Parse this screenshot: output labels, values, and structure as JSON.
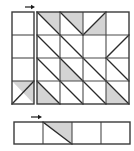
{
  "figure": {
    "background_color": "#ffffff",
    "shade_color": "#d4d4d4",
    "line_color": "#3a3a3a",
    "diagonal_color": "#2b2b2b",
    "arrow_color": "#1a1a1a",
    "width_px": 134,
    "height_px": 151
  },
  "left_strip": {
    "name": "left vertical strip",
    "x": 12,
    "y": 12,
    "width": 22,
    "height": 92,
    "columns": 1,
    "rows": 4,
    "cells": [
      {
        "row": 0,
        "col": 0,
        "diagonal": "none",
        "shaded_half": "none"
      },
      {
        "row": 1,
        "col": 0,
        "diagonal": "none",
        "shaded_half": "none"
      },
      {
        "row": 2,
        "col": 0,
        "diagonal": "none",
        "shaded_half": "none"
      },
      {
        "row": 3,
        "col": 0,
        "diagonal": "anti",
        "shaded_half": "upper-right"
      }
    ],
    "arrow": {
      "x1": 25,
      "y1": 7,
      "x2": 35,
      "y2": 7,
      "direction": "right"
    }
  },
  "main_grid": {
    "name": "main four by four grid",
    "x": 37,
    "y": 12,
    "width": 92,
    "height": 92,
    "columns": 4,
    "rows": 4,
    "cells": [
      {
        "row": 0,
        "col": 0,
        "diagonal": "main",
        "shaded_half": "upper-right"
      },
      {
        "row": 0,
        "col": 1,
        "diagonal": "main",
        "shaded_half": "upper-right"
      },
      {
        "row": 0,
        "col": 2,
        "diagonal": "anti",
        "shaded_half": "lower-right"
      },
      {
        "row": 0,
        "col": 3,
        "diagonal": "none",
        "shaded_half": "none"
      },
      {
        "row": 1,
        "col": 0,
        "diagonal": "main",
        "shaded_half": "none"
      },
      {
        "row": 1,
        "col": 1,
        "diagonal": "main",
        "shaded_half": "none"
      },
      {
        "row": 1,
        "col": 2,
        "diagonal": "none",
        "shaded_half": "none"
      },
      {
        "row": 1,
        "col": 3,
        "diagonal": "anti",
        "shaded_half": "none"
      },
      {
        "row": 2,
        "col": 0,
        "diagonal": "main",
        "shaded_half": "none"
      },
      {
        "row": 2,
        "col": 1,
        "diagonal": "main",
        "shaded_half": "lower-left"
      },
      {
        "row": 2,
        "col": 2,
        "diagonal": "main",
        "shaded_half": "none"
      },
      {
        "row": 2,
        "col": 3,
        "diagonal": "main",
        "shaded_half": "none"
      },
      {
        "row": 3,
        "col": 0,
        "diagonal": "main",
        "shaded_half": "lower-left"
      },
      {
        "row": 3,
        "col": 1,
        "diagonal": "main",
        "shaded_half": "none"
      },
      {
        "row": 3,
        "col": 2,
        "diagonal": "main",
        "shaded_half": "none"
      },
      {
        "row": 3,
        "col": 3,
        "diagonal": "main",
        "shaded_half": "lower-left"
      }
    ]
  },
  "bottom_strip": {
    "name": "bottom horizontal strip",
    "x": 14,
    "y": 122,
    "width": 116,
    "height": 22,
    "columns": 4,
    "rows": 1,
    "cells": [
      {
        "row": 0,
        "col": 0,
        "diagonal": "none",
        "shaded_half": "none"
      },
      {
        "row": 0,
        "col": 1,
        "diagonal": "main",
        "shaded_half": "upper-right"
      },
      {
        "row": 0,
        "col": 2,
        "diagonal": "none",
        "shaded_half": "none"
      },
      {
        "row": 0,
        "col": 3,
        "diagonal": "none",
        "shaded_half": "none"
      }
    ],
    "arrow": {
      "x1": 31,
      "y1": 117,
      "x2": 42,
      "y2": 117,
      "direction": "right"
    }
  }
}
